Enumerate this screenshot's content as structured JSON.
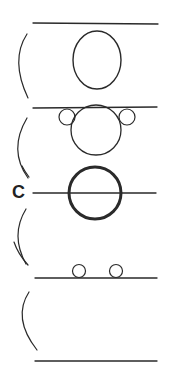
{
  "diagram": {
    "label": "C",
    "top_caption": "",
    "colors": {
      "stroke": "#2a2a2a",
      "background": "#ffffff"
    },
    "panels": [
      {
        "name": "panel-1",
        "line_y": 23,
        "shape": "oval"
      },
      {
        "name": "panel-2",
        "line_y": 108,
        "shape": "circle-with-two-small-circles-above-line"
      },
      {
        "name": "panel-3",
        "line_y": 193,
        "shape": "thick-circle-bisected-by-line"
      },
      {
        "name": "panel-4",
        "line_y": 278,
        "shape": "two-small-circles-on-line"
      },
      {
        "name": "panel-5",
        "line_y": 361,
        "shape": "empty"
      }
    ]
  }
}
